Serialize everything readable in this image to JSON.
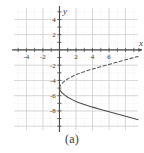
{
  "figure": {
    "caption": "(a)",
    "background": "#ffffff"
  },
  "axes": {
    "x_axis_label": "x",
    "y_axis_label": "y",
    "axis_color": "#4a4a4a",
    "grid_color": "#c9c9c9",
    "label_color": "#3d3d3d",
    "x_tick_labels": [
      "-4",
      "-2",
      "2",
      "4",
      "6"
    ],
    "x_tick_values": [
      -4,
      -2,
      2,
      4,
      6
    ],
    "y_tick_labels": [
      "4",
      "2",
      "-2",
      "-4",
      "-6",
      "-8"
    ],
    "y_tick_values": [
      4,
      2,
      -2,
      -4,
      -6,
      -8
    ]
  },
  "chart_data": {
    "type": "line",
    "title": "",
    "subtitle": "",
    "xlabel": "x",
    "ylabel": "y",
    "xlim": [
      -5.5,
      9.5
    ],
    "ylim": [
      -10.5,
      5.5
    ],
    "grid": true,
    "grid_major_step": 2,
    "grid_minor_step": 1,
    "legend": "none",
    "annotations": [],
    "series": [
      {
        "name": "upper-branch",
        "style": "dashed",
        "color": "#5a5a5a",
        "description": "upper half of sideways parabola, dashed",
        "x": [
          0.0,
          0.1,
          0.3,
          0.6,
          1.0,
          1.6,
          2.2,
          3.0,
          4.0,
          5.0,
          6.0,
          7.0,
          8.0,
          9.0,
          9.5
        ],
        "y": [
          -5.0,
          -4.65,
          -4.4,
          -4.1,
          -3.8,
          -3.45,
          -3.15,
          -2.85,
          -2.5,
          -2.2,
          -1.9,
          -1.6,
          -1.3,
          -1.0,
          -0.85
        ]
      },
      {
        "name": "lower-branch",
        "style": "solid",
        "color": "#4a4a4a",
        "description": "lower half of sideways parabola, solid",
        "x": [
          0.0,
          0.1,
          0.3,
          0.6,
          1.0,
          1.6,
          2.2,
          3.0,
          4.0,
          5.0,
          6.0,
          7.0,
          8.0,
          9.0,
          9.5
        ],
        "y": [
          -5.0,
          -5.35,
          -5.6,
          -5.9,
          -6.2,
          -6.55,
          -6.85,
          -7.15,
          -7.5,
          -7.8,
          -8.1,
          -8.4,
          -8.7,
          -9.0,
          -9.15
        ]
      }
    ],
    "vertex": {
      "x": 0,
      "y": -5
    }
  }
}
